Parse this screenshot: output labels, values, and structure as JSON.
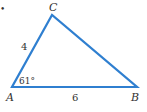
{
  "diagram": {
    "type": "triangle",
    "stroke_color": "#2f7fd0",
    "label_color": "#333333",
    "vertices": {
      "A": {
        "label": "A",
        "x": 12,
        "y": 87
      },
      "B": {
        "label": "B",
        "x": 137,
        "y": 87
      },
      "C": {
        "label": "C",
        "x": 52,
        "y": 15
      }
    },
    "sides": {
      "AC": {
        "label": "4"
      },
      "AB": {
        "label": "6"
      }
    },
    "angles": {
      "A": {
        "label": "61°"
      }
    },
    "marker": "•"
  }
}
